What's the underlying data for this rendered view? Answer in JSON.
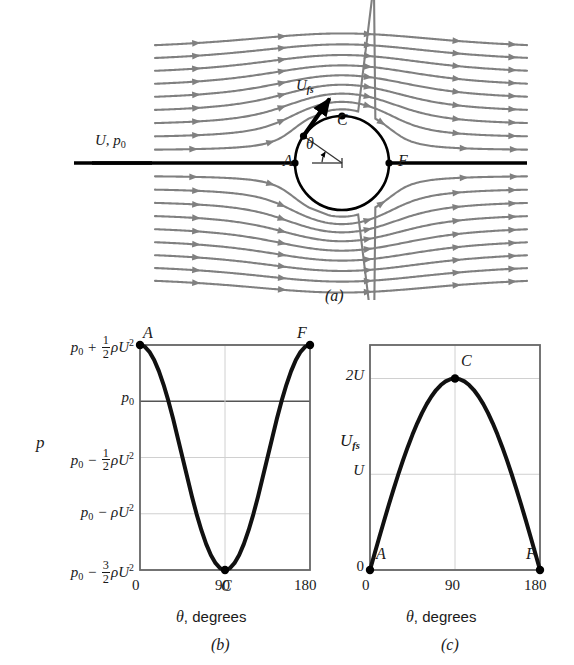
{
  "figure": {
    "panels": [
      {
        "id": "a",
        "caption": "(a)",
        "name": "potential-flow-around-cylinder",
        "freestream_label": "U, p",
        "freestream_sub": "0",
        "surface_speed_label": "U",
        "surface_speed_sub": "fs",
        "angle_label": "θ",
        "points": [
          {
            "label": "A",
            "angle_deg": 180,
            "position": "front-stagnation"
          },
          {
            "label": "C",
            "angle_deg": 90,
            "position": "top-shoulder"
          },
          {
            "label": "F",
            "angle_deg": 0,
            "position": "rear-stagnation"
          }
        ]
      },
      {
        "id": "b",
        "caption": "(b)",
        "name": "pressure-distribution-chart",
        "xlabel_symbol": "θ",
        "xlabel_text": ", degrees",
        "ylabel": "p"
      },
      {
        "id": "c",
        "caption": "(c)",
        "name": "surface-velocity-chart",
        "xlabel_symbol": "θ",
        "xlabel_text": ", degrees",
        "ylabel_symbol": "U",
        "ylabel_sub": "fs"
      }
    ]
  },
  "chart_data": [
    {
      "type": "line",
      "id": "b",
      "title": "",
      "xlabel": "θ, degrees",
      "ylabel": "p",
      "xlim": [
        0,
        180
      ],
      "ylim": [
        -1.5,
        0.5
      ],
      "xticks": [
        0,
        90,
        180
      ],
      "xticklabels": [
        "0",
        "90",
        "180"
      ],
      "yticks": [
        0.5,
        0,
        -0.5,
        -1,
        -1.5
      ],
      "yticklabels": [
        "p0 + 1/2 rho U^2",
        "p0",
        "p0 - 1/2 rho U^2",
        "p0 - rho U^2",
        "p0 - 3/2 rho U^2"
      ],
      "ytick_parts": [
        {
          "base": "p",
          "sub": "0",
          "op": "+",
          "frac_num": "1",
          "frac_den": "2",
          "tail": "ρU",
          "sup": "2"
        },
        {
          "base": "p",
          "sub": "0",
          "op": "",
          "frac_num": "",
          "frac_den": "",
          "tail": "",
          "sup": ""
        },
        {
          "base": "p",
          "sub": "0",
          "op": "−",
          "frac_num": "1",
          "frac_den": "2",
          "tail": "ρU",
          "sup": "2"
        },
        {
          "base": "p",
          "sub": "0",
          "op": "−",
          "frac_num": "",
          "frac_den": "",
          "tail": "ρU",
          "sup": "2"
        },
        {
          "base": "p",
          "sub": "0",
          "op": "−",
          "frac_num": "3",
          "frac_den": "2",
          "tail": "ρU",
          "sup": "2"
        }
      ],
      "grid": true,
      "legend": false,
      "equation": "p = p0 + 0.5*rho*U^2*(1 - 4*sin^2(theta))",
      "x": [
        0,
        5,
        10,
        15,
        20,
        25,
        30,
        35,
        40,
        45,
        50,
        55,
        60,
        65,
        70,
        75,
        80,
        85,
        90,
        95,
        100,
        105,
        110,
        115,
        120,
        125,
        130,
        135,
        140,
        145,
        150,
        155,
        160,
        165,
        170,
        175,
        180
      ],
      "values": [
        0.5,
        0.4848,
        0.4397,
        0.3665,
        0.2679,
        0.1464,
        0.005,
        -0.1534,
        -0.3264,
        -0.5,
        -0.6736,
        -0.8466,
        -1.005,
        -1.1464,
        -1.2679,
        -1.3665,
        -1.4397,
        -1.4848,
        -1.5,
        -1.4848,
        -1.4397,
        -1.3665,
        -1.2679,
        -1.1464,
        -1.005,
        -0.8466,
        -0.6736,
        -0.5,
        -0.3264,
        -0.1534,
        0.005,
        0.1464,
        0.2679,
        0.3665,
        0.4397,
        0.4848,
        0.5
      ],
      "markers": [
        {
          "label": "A",
          "x": 0,
          "y": 0.5
        },
        {
          "label": "C",
          "x": 90,
          "y": -1.5
        },
        {
          "label": "F",
          "x": 180,
          "y": 0.5
        }
      ]
    },
    {
      "type": "line",
      "id": "c",
      "title": "",
      "xlabel": "θ, degrees",
      "ylabel": "U_fs",
      "xlim": [
        0,
        180
      ],
      "ylim": [
        0,
        2.35
      ],
      "xticks": [
        0,
        90,
        180
      ],
      "xticklabels": [
        "0",
        "90",
        "180"
      ],
      "yticks": [
        0,
        1,
        2
      ],
      "yticklabels": [
        "0",
        "U",
        "2U"
      ],
      "grid": true,
      "legend": false,
      "equation": "U_fs = 2*U*sin(theta)",
      "x": [
        0,
        5,
        10,
        15,
        20,
        25,
        30,
        35,
        40,
        45,
        50,
        55,
        60,
        65,
        70,
        75,
        80,
        85,
        90,
        95,
        100,
        105,
        110,
        115,
        120,
        125,
        130,
        135,
        140,
        145,
        150,
        155,
        160,
        165,
        170,
        175,
        180
      ],
      "values": [
        0,
        0.1743,
        0.3473,
        0.5176,
        0.684,
        0.8452,
        1.0,
        1.1472,
        1.2856,
        1.4142,
        1.5321,
        1.6383,
        1.7321,
        1.8126,
        1.8794,
        1.9319,
        1.9696,
        1.9924,
        2.0,
        1.9924,
        1.9696,
        1.9319,
        1.8794,
        1.8126,
        1.7321,
        1.6383,
        1.5321,
        1.4142,
        1.2856,
        1.1472,
        1.0,
        0.8452,
        0.684,
        0.5176,
        0.3473,
        0.1743,
        0
      ],
      "markers": [
        {
          "label": "A",
          "x": 0,
          "y": 0
        },
        {
          "label": "C",
          "x": 90,
          "y": 2.0
        },
        {
          "label": "F",
          "x": 180,
          "y": 0
        }
      ]
    }
  ],
  "colors": {
    "streamline": "#808080",
    "curve": "#111111",
    "axis": "#666666",
    "grid": "#d0d0d0",
    "emphasis": "#000000",
    "text": "#1a1a1a"
  }
}
